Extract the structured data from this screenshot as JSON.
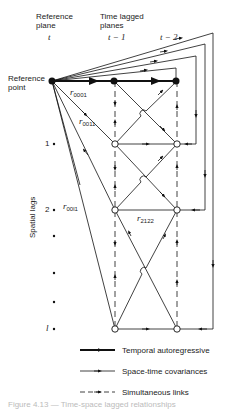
{
  "header": {
    "reference_plane": [
      "Reference",
      "plane"
    ],
    "time_lagged_planes": [
      "Time lagged",
      "planes"
    ],
    "t_labels": [
      "t",
      "t − 1",
      "t − 2"
    ]
  },
  "reference_point_label": [
    "Reference",
    "point"
  ],
  "axis_label": "Spatial lags",
  "spatial_lags": [
    "1",
    "2",
    "",
    "",
    "l"
  ],
  "edge_labels": {
    "r0001": {
      "r": "r",
      "sub": "0001"
    },
    "r0011": {
      "r": "r",
      "sub": "0011"
    },
    "r00l1": {
      "r": "r",
      "sub": "00l1"
    },
    "r2122": {
      "r": "r",
      "sub": "2122"
    }
  },
  "legend": [
    {
      "style": "thick-solid",
      "label": "Temporal autoregressive"
    },
    {
      "style": "thin-solid",
      "label": "Space-time covariances"
    },
    {
      "style": "dashed",
      "label": "Simultaneous links"
    }
  ],
  "caption": "Figure 4.13 — Time-space lagged relationships"
}
